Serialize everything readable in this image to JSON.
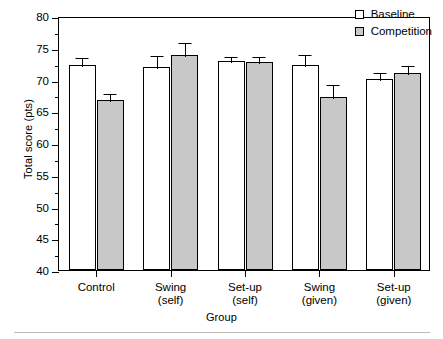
{
  "chart_data": {
    "type": "bar",
    "title": "",
    "xlabel": "Group",
    "ylabel": "Total score (pts)",
    "ylim": [
      40,
      80
    ],
    "ytick_step": 5,
    "yminor_step": 2.5,
    "grid": false,
    "legend_position": "top-right",
    "categories": [
      "Control",
      "Swing\n(self)",
      "Set-up\n(self)",
      "Swing\n(given)",
      "Set-up\n(given)"
    ],
    "category_lines": [
      [
        "Control",
        ""
      ],
      [
        "Swing",
        "(self)"
      ],
      [
        "Set-up",
        "(self)"
      ],
      [
        "Swing",
        "(given)"
      ],
      [
        "Set-up",
        "(given)"
      ]
    ],
    "yticks": [
      40,
      45,
      50,
      55,
      60,
      65,
      70,
      75,
      80
    ],
    "ytick_labels": [
      "40",
      "45",
      "50",
      "55",
      "60",
      "65",
      "70",
      "75",
      "80"
    ],
    "series": [
      {
        "name": "Baseline",
        "color": "#ffffff",
        "values": [
          72.3,
          72.0,
          72.9,
          72.3,
          70.1
        ],
        "errors": [
          1.4,
          2.0,
          1.0,
          1.8,
          1.2
        ]
      },
      {
        "name": "Competition",
        "color": "#c8c8c8",
        "values": [
          66.7,
          73.8,
          72.8,
          67.3,
          71.0
        ],
        "errors": [
          1.3,
          2.2,
          1.1,
          2.1,
          1.5
        ]
      }
    ]
  },
  "legend": {
    "items": [
      {
        "label": "Baseline",
        "swatch": "white-square"
      },
      {
        "label": "Competition",
        "swatch": "gray-square"
      }
    ]
  },
  "axes": {
    "x_title": "Group",
    "y_title": "Total score (pts)"
  }
}
